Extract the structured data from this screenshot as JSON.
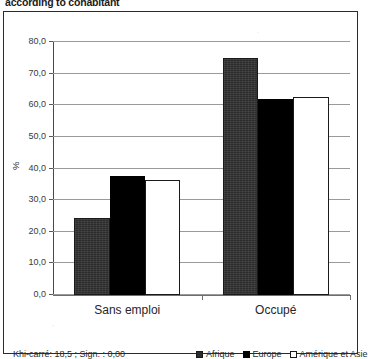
{
  "page_title": "according to cohabitant",
  "footer": {
    "stat_note": "Khi-carré: 18,5 ; Sign. : 0,00"
  },
  "legend": {
    "items": [
      {
        "label": "Afrique",
        "swatch": "dark-gray-square",
        "color": "#2c2c2c"
      },
      {
        "label": "Europe",
        "swatch": "black-square",
        "color": "#000000"
      },
      {
        "label": "Amérique et Asie",
        "swatch": "white-outlined-square",
        "color": "#ffffff"
      }
    ]
  },
  "chart_data": {
    "type": "bar",
    "title": "according to cohabitant",
    "xlabel": "",
    "ylabel": "%",
    "ylim": [
      0,
      80
    ],
    "ytick_step": 10,
    "yticks": [
      "0,0",
      "10,0",
      "20,0",
      "30,0",
      "40,0",
      "50,0",
      "60,0",
      "70,0",
      "80,0"
    ],
    "grid": true,
    "legend_position": "bottom-right",
    "categories": [
      "Sans emploi",
      "Occupé"
    ],
    "series": [
      {
        "name": "Afrique",
        "color": "#2c2c2c",
        "values": [
          24.5,
          75.0
        ]
      },
      {
        "name": "Europe",
        "color": "#000000",
        "values": [
          37.5,
          62.0
        ]
      },
      {
        "name": "Amérique et Asie",
        "color": "#ffffff",
        "values": [
          36.5,
          62.5
        ]
      }
    ],
    "annotations": [
      "Khi-carré: 18,5 ; Sign. : 0,00"
    ]
  }
}
